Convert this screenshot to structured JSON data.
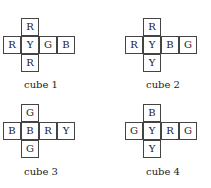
{
  "cubes": [
    {
      "label": "cube 1",
      "top": "R",
      "row": [
        "R",
        "Y",
        "G",
        "B"
      ],
      "bottom": "R"
    },
    {
      "label": "cube 2",
      "top": "R",
      "row": [
        "R",
        "Y",
        "B",
        "G"
      ],
      "bottom": "Y"
    },
    {
      "label": "cube 3",
      "top": "G",
      "row": [
        "B",
        "B",
        "R",
        "Y"
      ],
      "bottom": "G"
    },
    {
      "label": "cube 4",
      "top": "B",
      "row": [
        "G",
        "Y",
        "R",
        "G"
      ],
      "bottom": "Y"
    }
  ]
}
